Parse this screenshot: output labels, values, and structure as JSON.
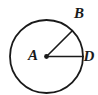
{
  "figure": {
    "type": "circle-with-radii",
    "background_color": "#ffffff",
    "stroke_color": "#1a1a1a",
    "label_color": "#1a1a1a",
    "circle": {
      "center_x": 46.5,
      "center_y": 56.5,
      "radius": 36.5,
      "stroke_width": 1.8
    },
    "center_point": {
      "label": "A",
      "x": 46.5,
      "y": 56.5,
      "dot_radius": 2.4
    },
    "radii": [
      {
        "name": "radius-AB",
        "from_x": 46.5,
        "from_y": 56.5,
        "to_x": 72.3,
        "to_y": 30.7,
        "stroke_width": 1.6
      },
      {
        "name": "radius-AD",
        "from_x": 46.5,
        "from_y": 56.5,
        "to_x": 83.0,
        "to_y": 56.5,
        "stroke_width": 1.6
      }
    ],
    "labels": [
      {
        "key": "label_a",
        "text": "A",
        "x": 33.0,
        "y": 60.0
      },
      {
        "key": "label_b",
        "text": "B",
        "x": 79.0,
        "y": 18.0
      },
      {
        "key": "label_d",
        "text": "D",
        "x": 89.0,
        "y": 61.0
      }
    ],
    "label_a": "A",
    "label_b": "B",
    "label_d": "D"
  }
}
